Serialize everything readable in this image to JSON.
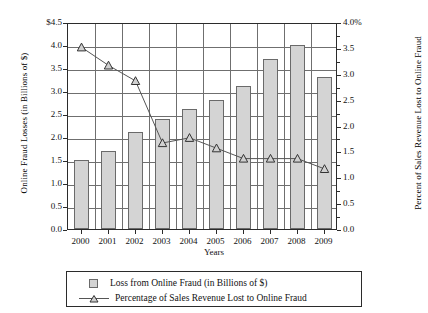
{
  "chart_data": {
    "type": "bar",
    "title": "",
    "xlabel": "Years",
    "ylabel": "Online Fraud Losses (in Billions of $)",
    "y2label": "Percent of Sales Revenue Lost to Online Fraud",
    "categories": [
      "2000",
      "2001",
      "2002",
      "2003",
      "2004",
      "2005",
      "2006",
      "2007",
      "2008",
      "2009"
    ],
    "ylim": [
      0,
      4.5
    ],
    "y2lim": [
      0,
      4.0
    ],
    "grid": true,
    "legend_position": "below-plot",
    "y_ticklabels": [
      "$4.5",
      "4.0",
      "3.5",
      "3.0",
      "2.5",
      "2.0",
      "1.5",
      "1.0",
      "0.5",
      "0.0"
    ],
    "y_tickvalues": [
      4.5,
      4.0,
      3.5,
      3.0,
      2.5,
      2.0,
      1.5,
      1.0,
      0.5,
      0.0
    ],
    "y2_ticklabels": [
      "4.0%",
      "3.5",
      "3.0",
      "2.5",
      "2.0",
      "1.5",
      "1.0",
      "0.5",
      "0.0"
    ],
    "y2_tickvalues": [
      4.0,
      3.5,
      3.0,
      2.5,
      2.0,
      1.5,
      1.0,
      0.5,
      0.0
    ],
    "series": [
      {
        "name": "Loss from Online Fraud (in Billions of $)",
        "kind": "bar",
        "axis": "left",
        "unit": "billions of dollars",
        "values": [
          1.5,
          1.7,
          2.1,
          2.4,
          2.6,
          2.8,
          3.1,
          3.7,
          4.0,
          3.3
        ]
      },
      {
        "name": "Percentage of Sales Revenue Lost to Online Fraud",
        "kind": "line",
        "axis": "right",
        "marker": "triangle",
        "unit": "percent",
        "values": [
          3.55,
          3.2,
          2.9,
          1.7,
          1.8,
          1.6,
          1.4,
          1.4,
          1.4,
          1.2
        ]
      }
    ]
  },
  "legend": {
    "items": [
      {
        "label": "Loss from Online Fraud (in Billions of $)",
        "marker": "square-swatch"
      },
      {
        "label": "Percentage of Sales Revenue Lost to Online Fraud",
        "marker": "line-triangle"
      }
    ]
  },
  "colors": {
    "bar_fill": "#d4d4d4",
    "bar_stroke": "#6a6a6a",
    "line": "#555555",
    "axis": "#2b2b2b",
    "grid": "#6f6f6f",
    "background": "#ffffff"
  }
}
